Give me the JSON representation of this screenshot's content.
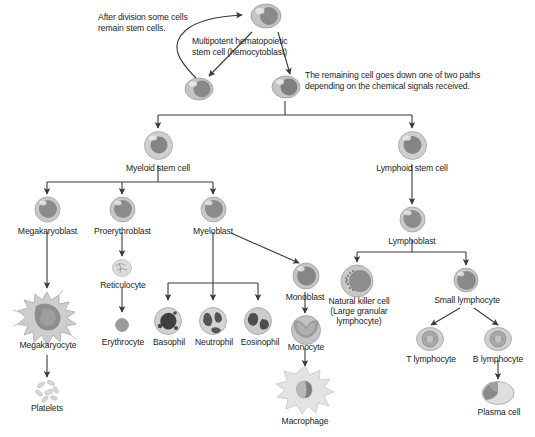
{
  "notes": {
    "stem_note": "After division some cells\nremain stem cells.",
    "hemocytoblast_note": "Multipotent hematopoietic\nstem cell (hemocytoblast)",
    "paths_note": "The remaining cell goes down one of two paths\ndepending on the chemical signals received."
  },
  "labels": {
    "myeloid_stem_cell": "Myeloid stem cell",
    "lymphoid_stem_cell": "Lymphoid stem cell",
    "megakaryoblast": "Megakaryoblast",
    "proerythroblast": "Proerythroblast",
    "myeloblast": "Myeloblast",
    "lymphoblast": "Lymphoblast",
    "reticulocyte": "Reticulocyte",
    "monoblast": "Monoblast",
    "megakaryocyte": "Megakaryocyte",
    "platelets": "Platelets",
    "erythrocyte": "Erythrocyte",
    "basophil": "Basophil",
    "neutrophil": "Neutrophil",
    "eosinophil": "Eosinophil",
    "monocyte": "Monocyte",
    "macrophage": "Macrophage",
    "natural_killer_cell": "Natural killer cell\n(Large granular\nlymphocyte)",
    "small_lymphocyte": "Small lymphocyte",
    "t_lymphocyte": "T lymphocyte",
    "b_lymphocyte": "B lymphocyte",
    "plasma_cell": "Plasma cell"
  },
  "colors": {
    "line": "#3a3a3a",
    "text": "#1d1d1d",
    "cell_body": "#b9b9b9",
    "cell_nucleus": "#6e6e6e",
    "background": "#ffffff"
  }
}
